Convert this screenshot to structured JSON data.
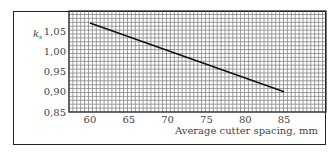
{
  "chart_data": {
    "type": "line",
    "title": "",
    "xlabel": "Average cutter spacing, mm",
    "ylabel": "k_s",
    "ylabel_main": "k",
    "ylabel_sub": "s",
    "xlim": [
      57.3,
      90.4
    ],
    "ylim": [
      0.85,
      1.1
    ],
    "x_ticks": [
      "60",
      "65",
      "70",
      "75",
      "80",
      "85"
    ],
    "y_ticks": [
      "1,05",
      "1,00",
      "0,95",
      "0,90",
      "0,85"
    ],
    "grid": true,
    "legend": null,
    "series": [
      {
        "name": "k_s",
        "x": [
          60,
          85
        ],
        "y": [
          1.07,
          0.9
        ]
      }
    ]
  },
  "colors": {
    "grid_line": "#777777",
    "data_line": "#111111",
    "frame": "#222222",
    "text": "#444444"
  }
}
